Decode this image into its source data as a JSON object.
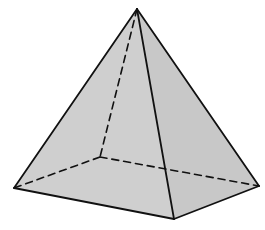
{
  "figure": {
    "type": "square-pyramid",
    "colors": {
      "background": "#ffffff",
      "face_fill": "#cfcfcf",
      "face_fill_right": "#c8c8c8",
      "edge": "#111111"
    },
    "vertices": {
      "apex": [
        137,
        9
      ],
      "base_left": [
        14,
        188
      ],
      "base_front": [
        174,
        219
      ],
      "base_right": [
        259,
        186
      ],
      "base_back": [
        100,
        157
      ]
    },
    "visible_edges": [
      [
        "apex",
        "base_left"
      ],
      [
        "apex",
        "base_front"
      ],
      [
        "apex",
        "base_right"
      ],
      [
        "base_left",
        "base_front"
      ],
      [
        "base_front",
        "base_right"
      ]
    ],
    "hidden_edges": [
      [
        "apex",
        "base_back"
      ],
      [
        "base_back",
        "base_left"
      ],
      [
        "base_back",
        "base_right"
      ]
    ]
  }
}
